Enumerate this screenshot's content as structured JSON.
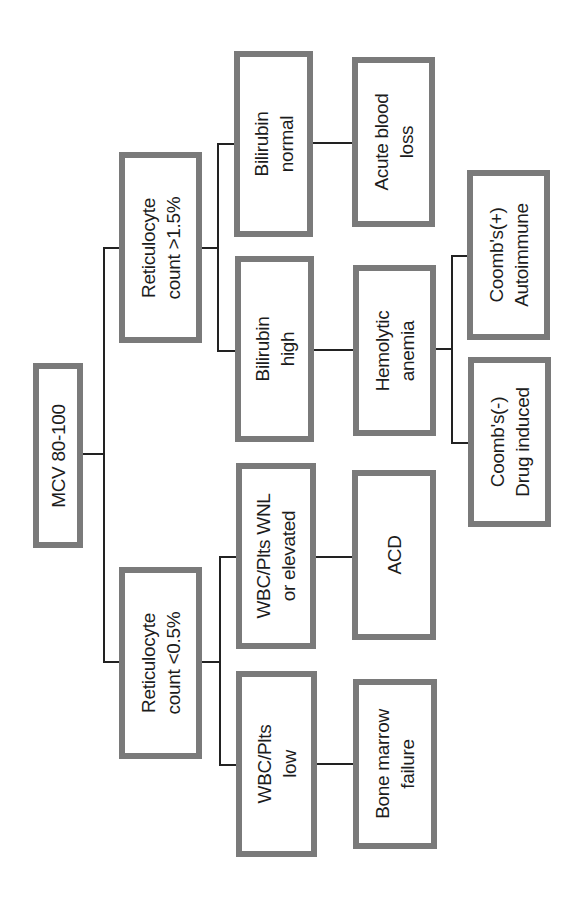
{
  "diagram": {
    "orientation": "rotated -90deg (root at left, text reads bottom-to-top)",
    "colors": {
      "box_border": "#7a7a7a",
      "connector": "#222222",
      "text": "#1c1c1c",
      "background": "#ffffff"
    },
    "root": {
      "label": "MCV 80-100"
    },
    "nodes": {
      "retic_high": "Reticulocyte\ncount >1.5%",
      "retic_low": "Reticulocyte\ncount <0.5%",
      "bili_normal": "Bilirubin\nnormal",
      "bili_high": "Bilirubin\nhigh",
      "wbc_wnl": "WBC/Plts WNL\nor elevated",
      "wbc_low": "WBC/Plts\nlow",
      "acute_blood_loss": "Acute blood\nloss",
      "hemolytic_anemia": "Hemolytic\nanemia",
      "acd": "ACD",
      "bone_marrow_failure": "Bone marrow\nfailure",
      "coombs_pos": "Coomb's(+)\nAutoimmune",
      "coombs_neg": "Coomb's(-)\nDrug induced"
    },
    "edges": [
      [
        "root",
        "retic_high"
      ],
      [
        "root",
        "retic_low"
      ],
      [
        "retic_high",
        "bili_normal"
      ],
      [
        "retic_high",
        "bili_high"
      ],
      [
        "bili_normal",
        "acute_blood_loss"
      ],
      [
        "bili_high",
        "hemolytic_anemia"
      ],
      [
        "hemolytic_anemia",
        "coombs_pos"
      ],
      [
        "hemolytic_anemia",
        "coombs_neg"
      ],
      [
        "retic_low",
        "wbc_wnl"
      ],
      [
        "retic_low",
        "wbc_low"
      ],
      [
        "wbc_wnl",
        "acd"
      ],
      [
        "wbc_low",
        "bone_marrow_failure"
      ]
    ]
  }
}
